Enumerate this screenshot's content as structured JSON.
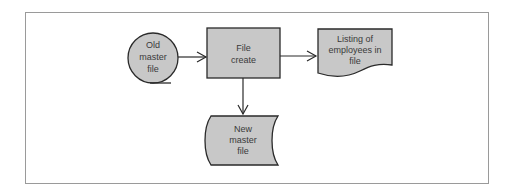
{
  "diagram": {
    "type": "system-flowchart",
    "colors": {
      "shape_fill": "#c8c8c8",
      "shape_stroke": "#2a2a2a",
      "frame_stroke": "#9a9a9a",
      "text": "#3a3a3a",
      "background": "#ffffff"
    },
    "nodes": [
      {
        "id": "old-master-file",
        "shape": "magnetic-tape",
        "lines": [
          "Old",
          "master",
          "file"
        ]
      },
      {
        "id": "file-create",
        "shape": "process",
        "lines": [
          "File",
          "create"
        ]
      },
      {
        "id": "listing-of-employees",
        "shape": "document",
        "lines": [
          "Listing of",
          "employees in",
          "file"
        ]
      },
      {
        "id": "new-master-file",
        "shape": "stored-data",
        "lines": [
          "New",
          "master",
          "file"
        ]
      }
    ],
    "edges": [
      {
        "from": "old-master-file",
        "to": "file-create"
      },
      {
        "from": "file-create",
        "to": "listing-of-employees"
      },
      {
        "from": "file-create",
        "to": "new-master-file"
      }
    ]
  }
}
